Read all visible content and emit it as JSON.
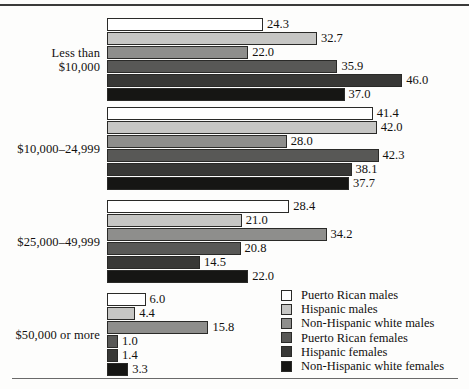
{
  "chart_data": {
    "type": "bar",
    "orientation": "horizontal",
    "title": "",
    "xlabel": "",
    "ylabel": "",
    "grid": false,
    "legend_position": "bottom-right",
    "xlim": [
      0,
      46
    ],
    "categories": [
      "Less than\n$10,000",
      "$10,000–24,999",
      "$25,000–49,999",
      "$50,000 or more"
    ],
    "category_lines": [
      [
        "Less than",
        "$10,000"
      ],
      [
        "$10,000–24,999"
      ],
      [
        "$25,000–49,999"
      ],
      [
        "$50,000 or more"
      ]
    ],
    "series": [
      {
        "name": "Puerto Rican males",
        "color": "#ffffff",
        "values": [
          24.3,
          41.4,
          28.4,
          6.0
        ]
      },
      {
        "name": "Hispanic males",
        "color": "#c6c6c4",
        "values": [
          32.7,
          42.0,
          21.0,
          4.4
        ]
      },
      {
        "name": "Non-Hispanic white males",
        "color": "#8e8e8c",
        "values": [
          22.0,
          28.0,
          34.2,
          15.8
        ]
      },
      {
        "name": "Puerto Rican females",
        "color": "#585856",
        "values": [
          35.9,
          42.3,
          20.8,
          1.0
        ]
      },
      {
        "name": "Hispanic females",
        "color": "#383836",
        "values": [
          46.0,
          38.1,
          14.5,
          1.4
        ]
      },
      {
        "name": "Non-Hispanic white females",
        "color": "#161614",
        "values": [
          37.0,
          37.7,
          22.0,
          3.3
        ]
      }
    ],
    "value_labels": [
      [
        "24.3",
        "32.7",
        "22.0",
        "35.9",
        "46.0",
        "37.0"
      ],
      [
        "41.4",
        "42.0",
        "28.0",
        "42.3",
        "38.1",
        "37.7"
      ],
      [
        "28.4",
        "21.0",
        "34.2",
        "20.8",
        "14.5",
        "22.0"
      ],
      [
        "6.0",
        "4.4",
        "15.8",
        "1.0",
        "1.4",
        "3.3"
      ]
    ]
  },
  "legend": {
    "items": [
      {
        "label": "Puerto Rican males"
      },
      {
        "label": "Hispanic males"
      },
      {
        "label": "Non-Hispanic white males"
      },
      {
        "label": "Puerto Rican females"
      },
      {
        "label": "Hispanic females"
      },
      {
        "label": "Non-Hispanic white females"
      }
    ]
  }
}
